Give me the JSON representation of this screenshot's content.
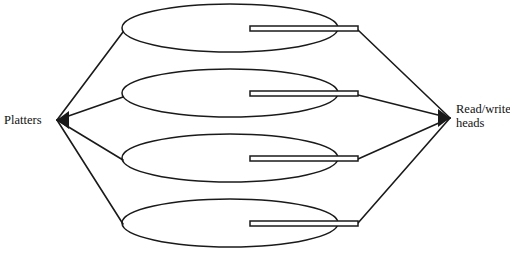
{
  "diagram": {
    "type": "schematic",
    "background_color": "#ffffff",
    "line_color": "#1a1a1a",
    "labels": {
      "left": {
        "text": "Platters",
        "x": 4,
        "y": 124,
        "anchor": "start"
      },
      "right": {
        "line1": "Read/write",
        "line2": "heads",
        "x": 456,
        "y1": 113,
        "y2": 127,
        "anchor": "start"
      }
    },
    "left_hub": {
      "x": 57,
      "y": 120
    },
    "right_hub": {
      "x": 450,
      "y": 118
    },
    "platters": [
      {
        "name": "platter-1",
        "cx": 230,
        "cy": 28,
        "rx": 108,
        "ry": 24
      },
      {
        "name": "platter-2",
        "cx": 230,
        "cy": 93,
        "rx": 108,
        "ry": 24
      },
      {
        "name": "platter-3",
        "cx": 230,
        "cy": 158,
        "rx": 108,
        "ry": 24
      },
      {
        "name": "platter-4",
        "cx": 230,
        "cy": 223,
        "rx": 108,
        "ry": 24
      }
    ],
    "arms": [
      {
        "name": "arm-1",
        "x": 250,
        "y": 26,
        "width": 108,
        "height": 5
      },
      {
        "name": "arm-2",
        "x": 250,
        "y": 91,
        "width": 108,
        "height": 5
      },
      {
        "name": "arm-3",
        "x": 250,
        "y": 156,
        "width": 108,
        "height": 5
      },
      {
        "name": "arm-4",
        "x": 250,
        "y": 221,
        "width": 108,
        "height": 5
      }
    ],
    "left_connectors": [
      {
        "name": "left-connector-1",
        "x1": 57,
        "y1": 120,
        "x2": 123,
        "y2": 32
      },
      {
        "name": "left-connector-2",
        "x1": 57,
        "y1": 120,
        "x2": 123,
        "y2": 97
      },
      {
        "name": "left-connector-3",
        "x1": 57,
        "y1": 120,
        "x2": 123,
        "y2": 160
      },
      {
        "name": "left-connector-4",
        "x1": 57,
        "y1": 120,
        "x2": 123,
        "y2": 224
      }
    ],
    "right_connectors": [
      {
        "name": "right-connector-1",
        "x1": 450,
        "y1": 118,
        "x2": 358,
        "y2": 30
      },
      {
        "name": "right-connector-2",
        "x1": 450,
        "y1": 118,
        "x2": 358,
        "y2": 95
      },
      {
        "name": "right-connector-3",
        "x1": 450,
        "y1": 118,
        "x2": 358,
        "y2": 159
      },
      {
        "name": "right-connector-4",
        "x1": 450,
        "y1": 118,
        "x2": 358,
        "y2": 223
      }
    ]
  }
}
